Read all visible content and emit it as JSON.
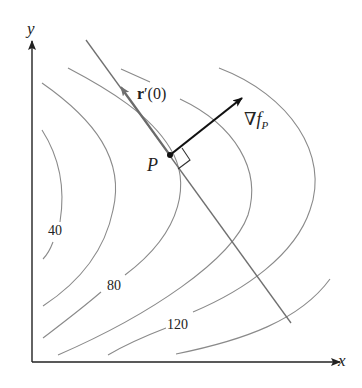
{
  "diagram": {
    "axes": {
      "x_label": "x",
      "y_label": "y"
    },
    "point": {
      "label": "P"
    },
    "tangent_vector": {
      "bold": "r",
      "rest": "′(0)"
    },
    "gradient_vector": {
      "symbol": "∇",
      "f": "f",
      "sub": "P"
    },
    "level_labels": [
      "40",
      "80",
      "120"
    ],
    "colors": {
      "contour": "#8a8a8a",
      "axis": "#222222",
      "tangent_line": "#707070",
      "gradient": "#111111"
    }
  }
}
